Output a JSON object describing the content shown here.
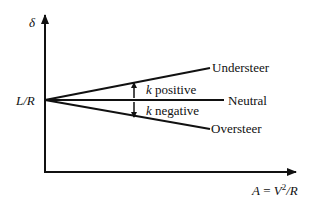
{
  "diagram": {
    "y_axis_label": "δ",
    "x_axis_label_lhs": "A",
    "x_axis_label_eq": " = ",
    "x_axis_label_V": "V",
    "x_axis_label_sup": "2",
    "x_axis_label_tail": "/R",
    "intercept_label": "L/R",
    "lines": [
      {
        "label": "Understeer"
      },
      {
        "label": "Neutral"
      },
      {
        "label": "Oversteer"
      }
    ],
    "k_positive": {
      "k": "k",
      "text": " positive"
    },
    "k_negative": {
      "k": "k",
      "text": " negative"
    },
    "colors": {
      "ink": "#111111",
      "background": "#ffffff"
    }
  }
}
